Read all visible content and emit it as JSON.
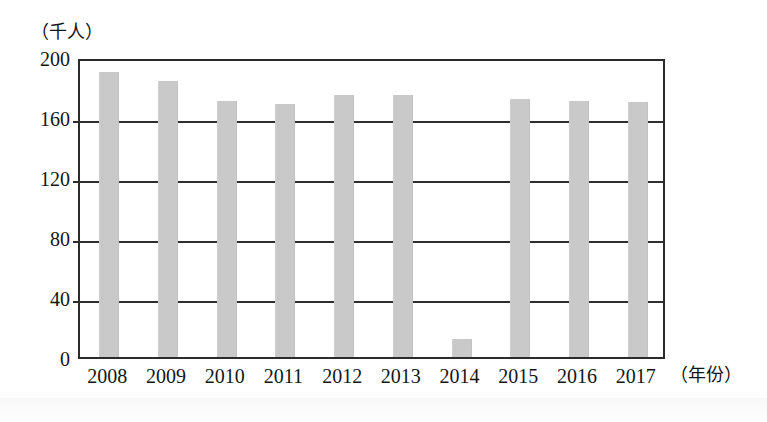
{
  "chart_data": {
    "type": "bar",
    "title": "",
    "subtitle": "",
    "xlabel": "（年份）",
    "ylabel": "（千人）",
    "categories": [
      "2008",
      "2009",
      "2010",
      "2011",
      "2012",
      "2013",
      "2014",
      "2015",
      "2016",
      "2017"
    ],
    "values": [
      190,
      184,
      171,
      169,
      175,
      175,
      12,
      172,
      171,
      170
    ],
    "ylim": [
      0,
      200
    ],
    "yticks": [
      0,
      40,
      80,
      120,
      160,
      200
    ],
    "ytick_labels": [
      "0",
      "40",
      "80",
      "120",
      "160",
      "200"
    ],
    "grid": true,
    "legend": false,
    "legend_position": "none",
    "series": [
      {
        "name": "",
        "values": [
          190,
          184,
          171,
          169,
          175,
          175,
          12,
          172,
          171,
          170
        ],
        "color": "#c9c9c9"
      }
    ]
  },
  "axes": {
    "y_unit_caption": "（千人）",
    "x_unit_caption": "（年份）"
  },
  "colors": {
    "bar_fill": "#c9c9c9",
    "axis_line": "#2b2b2b",
    "gridline": "#2e2e2e",
    "text": "#151515",
    "background": "#ffffff"
  }
}
